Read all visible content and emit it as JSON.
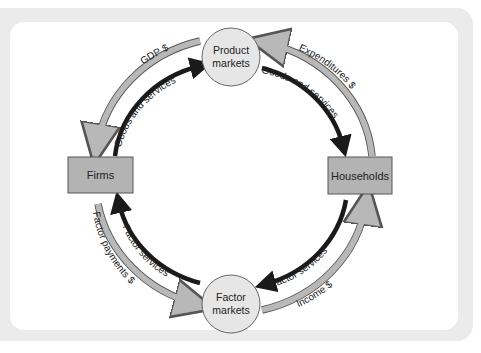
{
  "diagram": {
    "colors": {
      "frame": "#ebebeb",
      "panel": "#ffffff",
      "box_fill": "#b3b3b3",
      "circle_fill": "#e6e6e6",
      "money_arrow": "#b8b8b8",
      "goods_arrow": "#1a1a1a"
    },
    "nodes": {
      "product_markets": {
        "line1": "Product",
        "line2": "markets"
      },
      "factor_markets": {
        "line1": "Factor",
        "line2": "markets"
      },
      "firms": {
        "label": "Firms"
      },
      "households": {
        "label": "Households"
      }
    },
    "flows": {
      "gdp": {
        "label": "GDP $",
        "from": "Product markets",
        "to": "Firms",
        "type": "money"
      },
      "goods_firms": {
        "label": "Goods and services",
        "from": "Firms",
        "to": "Product markets",
        "type": "real"
      },
      "expenditures": {
        "label": "Expenditures $",
        "from": "Households",
        "to": "Product markets",
        "type": "money"
      },
      "goods_households": {
        "label": "Goods and services",
        "from": "Product markets",
        "to": "Households",
        "type": "real"
      },
      "factor_payments": {
        "label": "Factor payments $",
        "from": "Firms",
        "to": "Factor markets",
        "type": "money"
      },
      "factor_services_firms": {
        "label": "Factor services",
        "from": "Factor markets",
        "to": "Firms",
        "type": "real"
      },
      "factor_services_households": {
        "label": "Factor services",
        "from": "Households",
        "to": "Factor markets",
        "type": "real"
      },
      "income": {
        "label": "Income $",
        "from": "Factor markets",
        "to": "Households",
        "type": "money"
      }
    }
  }
}
